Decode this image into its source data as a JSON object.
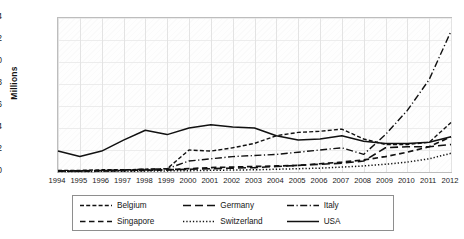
{
  "chart_data": {
    "type": "line",
    "title": "",
    "xlabel": "",
    "ylabel": "Millions",
    "ylim": [
      0,
      14
    ],
    "yticks": [
      0,
      2,
      4,
      6,
      8,
      10,
      12,
      14
    ],
    "grid": true,
    "legend_position": "bottom",
    "categories": [
      "1994",
      "1995",
      "1996",
      "1997",
      "1998",
      "1999",
      "2000",
      "2001",
      "2002",
      "2003",
      "2004",
      "2005",
      "2006",
      "2007",
      "2008",
      "2009",
      "2010",
      "2011",
      "2012"
    ],
    "series": [
      {
        "name": "Belgium",
        "style": "dashed",
        "values": [
          0.15,
          0.15,
          0.2,
          0.2,
          0.25,
          0.3,
          2.0,
          1.9,
          2.2,
          2.6,
          3.3,
          3.6,
          3.7,
          3.9,
          3.0,
          2.5,
          2.5,
          2.7,
          4.5
        ]
      },
      {
        "name": "Germany",
        "style": "long-dash",
        "values": [
          0.1,
          0.1,
          0.12,
          0.15,
          0.18,
          0.2,
          0.25,
          0.3,
          0.35,
          0.4,
          0.5,
          0.6,
          0.7,
          0.8,
          1.0,
          2.2,
          2.3,
          2.3,
          2.5
        ]
      },
      {
        "name": "Italy",
        "style": "dash-dot",
        "values": [
          0.1,
          0.12,
          0.15,
          0.18,
          0.25,
          0.3,
          1.0,
          1.2,
          1.4,
          1.5,
          1.6,
          1.8,
          2.0,
          2.2,
          1.6,
          3.4,
          5.6,
          8.4,
          12.8
        ]
      },
      {
        "name": "Singapore",
        "style": "medium-dash",
        "values": [
          0.08,
          0.08,
          0.1,
          0.12,
          0.15,
          0.2,
          0.3,
          0.4,
          0.45,
          0.5,
          0.55,
          0.6,
          0.75,
          0.9,
          1.1,
          1.4,
          1.8,
          2.3,
          3.2
        ]
      },
      {
        "name": "Switzerland",
        "style": "dotted",
        "values": [
          0.05,
          0.05,
          0.06,
          0.07,
          0.08,
          0.1,
          0.12,
          0.15,
          0.18,
          0.2,
          0.25,
          0.3,
          0.35,
          0.45,
          0.55,
          0.7,
          0.9,
          1.2,
          1.7
        ]
      },
      {
        "name": "USA",
        "style": "solid",
        "values": [
          1.9,
          1.4,
          1.9,
          2.9,
          3.8,
          3.4,
          4.0,
          4.3,
          4.1,
          4.0,
          3.3,
          2.9,
          3.0,
          3.3,
          2.8,
          2.6,
          2.6,
          2.7,
          3.2
        ]
      }
    ]
  },
  "legend": {
    "items": [
      {
        "label": "Belgium"
      },
      {
        "label": "Germany"
      },
      {
        "label": "Italy"
      },
      {
        "label": "Singapore"
      },
      {
        "label": "Switzerland"
      },
      {
        "label": "USA"
      }
    ]
  }
}
